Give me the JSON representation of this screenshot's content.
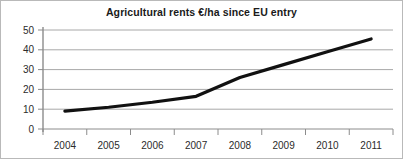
{
  "chart_data": {
    "type": "line",
    "title": "Agricultural rents €/ha since EU entry",
    "xlabel": "",
    "ylabel": "",
    "categories": [
      "2004",
      "2005",
      "2006",
      "2007",
      "2008",
      "2009",
      "2010",
      "2011"
    ],
    "x": [
      2004,
      2005,
      2006,
      2007,
      2008,
      2009,
      2010,
      2011
    ],
    "values": [
      9,
      11,
      13.5,
      16.5,
      26,
      32.5,
      39,
      45.5
    ],
    "series": [
      {
        "name": "Agricultural rent",
        "values": [
          9,
          11,
          13.5,
          16.5,
          26,
          32.5,
          39,
          45.5
        ]
      }
    ],
    "ylim": [
      0,
      50
    ],
    "yticks": [
      0,
      10,
      20,
      30,
      40,
      50
    ],
    "ytick_labels": [
      "0",
      "10",
      "20",
      "30",
      "40",
      "50"
    ],
    "xtick_labels": [
      "2004",
      "2005",
      "2006",
      "2007",
      "2008",
      "2009",
      "2010",
      "2011"
    ],
    "grid": true,
    "grid_axis": "y",
    "legend": false,
    "legend_position": "none",
    "line_color": "#111111",
    "grid_color": "#a8a8a8",
    "axis_color": "#8c8c8c",
    "background_color": "#ffffff",
    "annotations": []
  },
  "figure": {
    "title": "Agricultural rents €/ha since EU entry",
    "border_color": "#b9b9b9"
  }
}
